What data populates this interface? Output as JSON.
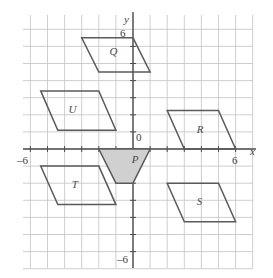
{
  "figure": {
    "type": "coordinate-grid-diagram",
    "background": "#ffffff",
    "grid_color": "#c8c8c8",
    "axis_color": "#4d4d4d",
    "shape_stroke": "#5a5a5a",
    "shape_fill_highlight": "#d0d0d0",
    "shape_fill_plain": "none"
  },
  "axes": {
    "x_label": "x",
    "y_label": "y",
    "origin_label": "0",
    "x_min_label": "–6",
    "x_max_label": "6",
    "y_max_label": "6",
    "y_min_label": "–6",
    "x_range": [
      -6,
      6
    ],
    "y_range": [
      -6,
      6
    ],
    "grid_step": 1
  },
  "chart_data": {
    "type": "scatter",
    "title": "",
    "xlabel": "x",
    "ylabel": "y",
    "xlim": [
      -6.5,
      7
    ],
    "ylim": [
      -7,
      7.5
    ],
    "grid": true,
    "legend": "none",
    "shapes": [
      {
        "name": "P",
        "label": "P",
        "filled": true,
        "vertices": [
          [
            -2,
            0
          ],
          [
            1,
            0
          ],
          [
            0,
            -2
          ],
          [
            -1,
            -2
          ]
        ],
        "label_point": [
          0.1,
          -0.65
        ]
      },
      {
        "name": "Q",
        "label": "Q",
        "filled": false,
        "vertices": [
          [
            -3,
            6.5
          ],
          [
            0,
            6.5
          ],
          [
            1,
            4.5
          ],
          [
            -2,
            4.5
          ]
        ],
        "label_point": [
          -1.2,
          5.7
        ]
      },
      {
        "name": "R",
        "label": "R",
        "filled": false,
        "vertices": [
          [
            2,
            2.25
          ],
          [
            5,
            2.25
          ],
          [
            6,
            0
          ],
          [
            3,
            0
          ]
        ],
        "label_point": [
          3.9,
          1.1
        ]
      },
      {
        "name": "S",
        "label": "S",
        "filled": false,
        "vertices": [
          [
            2,
            -2
          ],
          [
            5,
            -2
          ],
          [
            6,
            -4.25
          ],
          [
            3,
            -4.25
          ]
        ],
        "label_point": [
          3.9,
          -3.1
        ]
      },
      {
        "name": "T",
        "label": "T",
        "filled": false,
        "vertices": [
          [
            -5.4,
            -1
          ],
          [
            -2,
            -1
          ],
          [
            -1,
            -3.25
          ],
          [
            -4.4,
            -3.25
          ]
        ],
        "label_point": [
          -3.4,
          -2.1
        ]
      },
      {
        "name": "U",
        "label": "U",
        "filled": false,
        "vertices": [
          [
            -5.4,
            3.4
          ],
          [
            -2,
            3.4
          ],
          [
            -1,
            1.1
          ],
          [
            -4.4,
            1.1
          ]
        ],
        "label_point": [
          -3.6,
          2.3
        ]
      }
    ]
  },
  "labels": {
    "shapes": {
      "P": "P",
      "Q": "Q",
      "R": "R",
      "S": "S",
      "T": "T",
      "U": "U"
    },
    "axis": {
      "x": "x",
      "y": "y",
      "zero": "0",
      "neg_six_x": "–6",
      "pos_six_x": "6",
      "pos_six_y": "6",
      "neg_six_y": "–6"
    }
  }
}
